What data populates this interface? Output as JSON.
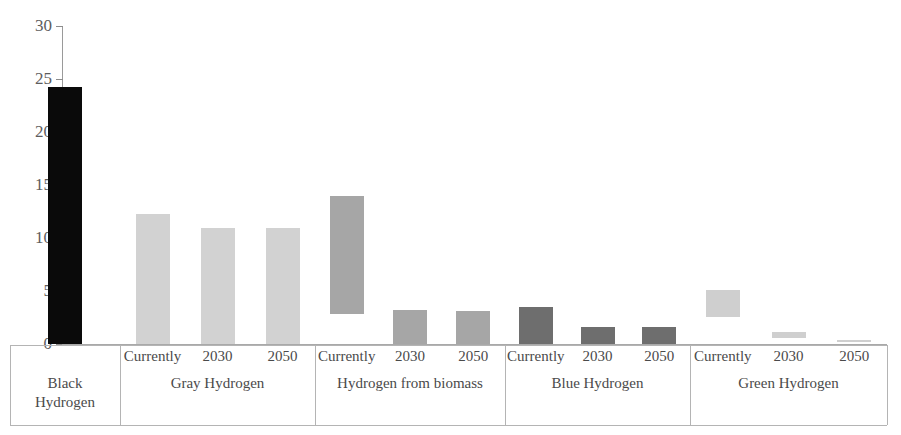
{
  "chart_data": {
    "type": "bar",
    "title": "",
    "subtitle": "",
    "xlabel": "",
    "ylabel": "",
    "ylim": [
      0,
      30
    ],
    "ytick_values": [
      0,
      5,
      10,
      15,
      20,
      25,
      30
    ],
    "ytick_labels": [
      "0",
      "5",
      "10",
      "15",
      "20",
      "25",
      "30"
    ],
    "grid": false,
    "legend": "none",
    "bar_style": "floating-range-bars",
    "groups": [
      {
        "name": "Black Hydrogen",
        "label_lines": [
          "Black",
          "Hydrogen"
        ],
        "color": "#0a0a0a",
        "bars": [
          {
            "period": "",
            "low": 0.0,
            "high": 24.2
          }
        ]
      },
      {
        "name": "Gray Hydrogen",
        "label_lines": [
          "Gray Hydrogen"
        ],
        "color": "#d2d2d2",
        "bars": [
          {
            "period": "Currently",
            "low": 0.0,
            "high": 12.3
          },
          {
            "period": "2030",
            "low": 0.0,
            "high": 10.9
          },
          {
            "period": "2050",
            "low": 0.0,
            "high": 10.9
          }
        ]
      },
      {
        "name": "Hydrogen from biomass",
        "label_lines": [
          "Hydrogen from biomass"
        ],
        "color": "#a6a6a6",
        "bars": [
          {
            "period": "Currently",
            "low": 2.8,
            "high": 14.0
          },
          {
            "period": "2030",
            "low": 0.0,
            "high": 3.2
          },
          {
            "period": "2050",
            "low": 0.0,
            "high": 3.1
          }
        ]
      },
      {
        "name": "Blue Hydrogen",
        "label_lines": [
          "Blue Hydrogen"
        ],
        "color": "#6e6e6e",
        "bars": [
          {
            "period": "Currently",
            "low": 0.0,
            "high": 3.5
          },
          {
            "period": "2030",
            "low": 0.0,
            "high": 1.6
          },
          {
            "period": "2050",
            "low": 0.0,
            "high": 1.6
          }
        ]
      },
      {
        "name": "Green Hydrogen",
        "label_lines": [
          "Green Hydrogen"
        ],
        "color": "#cfcfcf",
        "bars": [
          {
            "period": "Currently",
            "low": 2.5,
            "high": 5.1
          },
          {
            "period": "2030",
            "low": 0.6,
            "high": 1.1
          },
          {
            "period": "2050",
            "low": 0.2,
            "high": 0.4
          }
        ]
      }
    ]
  },
  "axis": {
    "baseline_color": "#a9a9a9",
    "tick_color": "#8c8c8c",
    "label_color": "#5d5d5d"
  },
  "label_table": {
    "border_color": "#b4b4b4",
    "text_color": "#4a4a4a"
  }
}
